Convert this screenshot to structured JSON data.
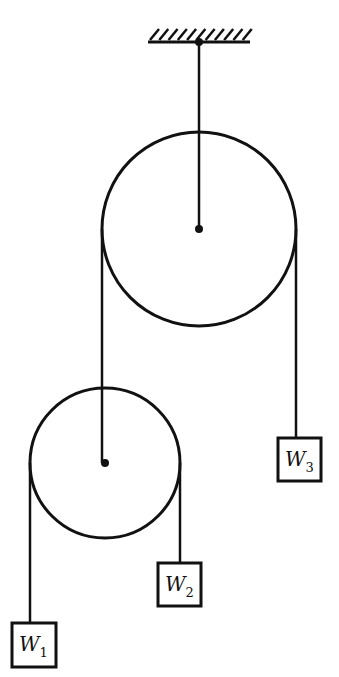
{
  "diagram": {
    "type": "pulley-system",
    "colors": {
      "stroke": "#111111",
      "background": "#ffffff"
    },
    "ceiling": {
      "x1": 148,
      "x2": 250,
      "y": 42,
      "hatch_count": 11
    },
    "pulleys": [
      {
        "id": "upper",
        "cx": 199,
        "cy": 229,
        "r": 97,
        "axle_hung_from": "ceiling"
      },
      {
        "id": "lower",
        "cx": 105,
        "cy": 463,
        "r": 75,
        "axle_hung_from": "upper-left-rope"
      }
    ],
    "weights": [
      {
        "id": "W1",
        "letter": "W",
        "subscript": "1",
        "x": 12,
        "y": 623,
        "size": 44
      },
      {
        "id": "W2",
        "letter": "W",
        "subscript": "2",
        "x": 158,
        "y": 563,
        "size": 43
      },
      {
        "id": "W3",
        "letter": "W",
        "subscript": "3",
        "x": 278,
        "y": 438,
        "size": 43
      }
    ]
  }
}
